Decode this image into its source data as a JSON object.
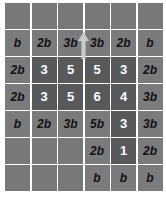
{
  "figure": {
    "name": "grid-table",
    "columns": 6,
    "rows": 7,
    "background_color": "#ffffff",
    "empty_cell_color": "#77787a",
    "light_cell_color": "#7a7b7d",
    "dark_cell_color": "#58595b",
    "light_text_color": "#121212",
    "dark_text_color": "#fdfdfd"
  },
  "arrow": {
    "name": "up-arrow-icon",
    "direction": "up",
    "color": "#c9cacb"
  },
  "cells": [
    [
      {
        "text": "",
        "style": "empty"
      },
      {
        "text": "",
        "style": "empty"
      },
      {
        "text": "",
        "style": "empty"
      },
      {
        "text": "",
        "style": "empty"
      },
      {
        "text": "",
        "style": "empty"
      },
      {
        "text": "",
        "style": "empty"
      }
    ],
    [
      {
        "text": "b",
        "style": "light"
      },
      {
        "text": "2b",
        "style": "light"
      },
      {
        "text": "3b",
        "style": "light"
      },
      {
        "text": "3b",
        "style": "light"
      },
      {
        "text": "2b",
        "style": "light"
      },
      {
        "text": "b",
        "style": "light"
      }
    ],
    [
      {
        "text": "2b",
        "style": "light"
      },
      {
        "text": "3",
        "style": "dark"
      },
      {
        "text": "5",
        "style": "dark"
      },
      {
        "text": "5",
        "style": "dark"
      },
      {
        "text": "3",
        "style": "dark"
      },
      {
        "text": "2b",
        "style": "light"
      }
    ],
    [
      {
        "text": "2b",
        "style": "light"
      },
      {
        "text": "3",
        "style": "dark"
      },
      {
        "text": "5",
        "style": "dark"
      },
      {
        "text": "6",
        "style": "dark"
      },
      {
        "text": "4",
        "style": "dark"
      },
      {
        "text": "3b",
        "style": "light"
      }
    ],
    [
      {
        "text": "b",
        "style": "light"
      },
      {
        "text": "2b",
        "style": "light"
      },
      {
        "text": "3b",
        "style": "light"
      },
      {
        "text": "5b",
        "style": "light"
      },
      {
        "text": "3",
        "style": "dark"
      },
      {
        "text": "3b",
        "style": "light"
      }
    ],
    [
      {
        "text": "",
        "style": "empty"
      },
      {
        "text": "",
        "style": "empty"
      },
      {
        "text": "",
        "style": "empty"
      },
      {
        "text": "2b",
        "style": "light"
      },
      {
        "text": "1",
        "style": "dark"
      },
      {
        "text": "2b",
        "style": "light"
      }
    ],
    [
      {
        "text": "",
        "style": "empty"
      },
      {
        "text": "",
        "style": "empty"
      },
      {
        "text": "",
        "style": "empty"
      },
      {
        "text": "b",
        "style": "light"
      },
      {
        "text": "b",
        "style": "light"
      },
      {
        "text": "b",
        "style": "light"
      }
    ]
  ]
}
